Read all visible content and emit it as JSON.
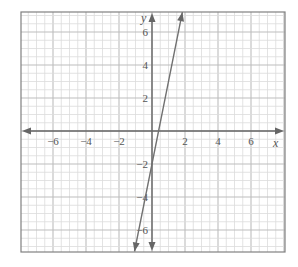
{
  "chart_data": {
    "type": "line",
    "title": "",
    "xlabel": "x",
    "ylabel": "y",
    "xlim": [
      -8,
      8
    ],
    "ylim": [
      -7.3,
      7.2
    ],
    "grid": true,
    "minor_grid_step": 0.5,
    "major_grid_step": 2,
    "x_ticks": [
      -6,
      -4,
      -2,
      2,
      4,
      6
    ],
    "y_ticks": [
      -6,
      -4,
      -2,
      2,
      4,
      6
    ],
    "x_tick_labels": [
      "−6",
      "−4",
      "−2",
      "2",
      "4",
      "6"
    ],
    "y_tick_labels": [
      "−6",
      "−4",
      "−2",
      "2",
      "4",
      "6"
    ],
    "series": [
      {
        "name": "line",
        "equation": "y = 5x - 2",
        "slope": 5,
        "intercept": -2,
        "x": [
          -1.06,
          0,
          0.4,
          1.84
        ],
        "y": [
          -7.3,
          -2,
          0,
          7.2
        ],
        "arrows_both_ends": true
      }
    ],
    "colors": {
      "grid_minor": "#dcdcdc",
      "grid_major": "#bdbdbd",
      "axis": "#666666",
      "line": "#707070",
      "frame": "#808080"
    }
  }
}
